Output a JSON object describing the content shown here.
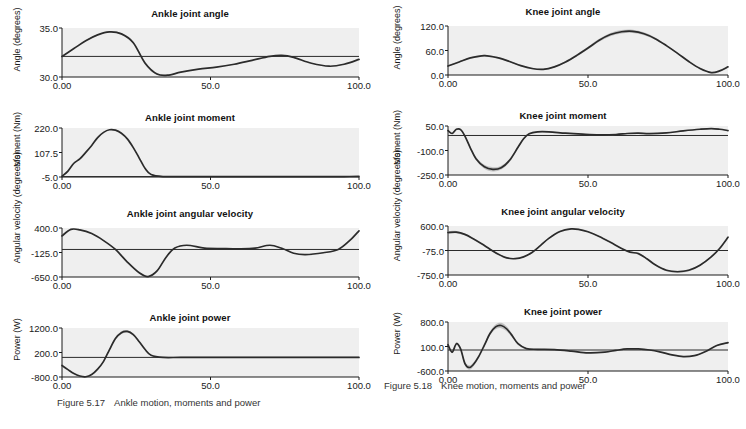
{
  "figures": [
    {
      "id": "ankle",
      "caption_number": "Figure 5.17",
      "caption_text": "Ankle motion, moments and power"
    },
    {
      "id": "knee",
      "caption_number": "Figure 5.18",
      "caption_text": "Knee motion, moments and power"
    }
  ],
  "chart_data": [
    {
      "type": "line",
      "id": "ankle-joint-angle",
      "title": "Ankle joint angle",
      "xlabel": "",
      "ylabel": "Angle (degrees)",
      "xlim": [
        0,
        100
      ],
      "ylim": [
        30.0,
        35.0
      ],
      "xticks": [
        0,
        50,
        100
      ],
      "xticklabels": [
        "0.00",
        "50.0",
        "100.0"
      ],
      "yticks": [
        35.0,
        30.0
      ],
      "yticklabels": [
        "35.0",
        "30.0"
      ],
      "grid": false,
      "mean_line": 32.1,
      "series": [
        {
          "name": "mean",
          "x": [
            0,
            4,
            8,
            12,
            16,
            20,
            24,
            28,
            32,
            36,
            40,
            46,
            52,
            58,
            64,
            70,
            74,
            78,
            84,
            90,
            95,
            100
          ],
          "values": [
            32.1,
            32.9,
            33.7,
            34.3,
            34.6,
            34.4,
            33.5,
            31.4,
            30.3,
            30.2,
            30.5,
            30.8,
            31.0,
            31.3,
            31.7,
            32.1,
            32.2,
            32.0,
            31.4,
            31.1,
            31.3,
            31.8
          ],
          "band_halfwidth": [
            0.02,
            0.03,
            0.04,
            0.05,
            0.06,
            0.09,
            0.13,
            0.14,
            0.09,
            0.04,
            0.03,
            0.02,
            0.02,
            0.02,
            0.02,
            0.02,
            0.02,
            0.02,
            0.02,
            0.02,
            0.02,
            0.02
          ]
        }
      ]
    },
    {
      "type": "line",
      "id": "ankle-joint-moment",
      "title": "Ankle joint moment",
      "xlabel": "",
      "ylabel": "Moment (Nm)",
      "xlim": [
        0,
        100
      ],
      "ylim": [
        -5.0,
        220.0
      ],
      "xticks": [
        0,
        50,
        100
      ],
      "xticklabels": [
        "0.00",
        "50.0",
        "100.0"
      ],
      "yticks": [
        220.0,
        107.5,
        -5.0
      ],
      "yticklabels": [
        "220.0",
        "107.5",
        "-5.0"
      ],
      "grid": false,
      "mean_line": -3.0,
      "series": [
        {
          "name": "mean",
          "x": [
            0,
            2,
            4,
            6,
            8,
            10,
            12,
            14,
            16,
            18,
            20,
            22,
            24,
            26,
            28,
            30,
            34,
            40,
            50,
            60,
            70,
            80,
            90,
            95,
            100
          ],
          "values": [
            -2.0,
            22.0,
            58.0,
            78.0,
            108.0,
            140.0,
            176.0,
            200.0,
            212.0,
            210.0,
            196.0,
            170.0,
            130.0,
            82.0,
            34.0,
            6.0,
            -3.0,
            -3.0,
            -3.0,
            -3.0,
            -3.0,
            -3.0,
            -3.5,
            -3.0,
            -2.5
          ]
        }
      ]
    },
    {
      "type": "line",
      "id": "ankle-joint-angular-velocity",
      "title": "Ankle joint angular velocity",
      "xlabel": "",
      "ylabel": "Angular velocity (degrees/s)",
      "xlim": [
        0,
        100
      ],
      "ylim": [
        -650.0,
        400.0
      ],
      "xticks": [
        0,
        50,
        100
      ],
      "xticklabels": [
        "0.00",
        "50.0",
        "100.0"
      ],
      "yticks": [
        400.0,
        -125.0,
        -650.0
      ],
      "yticklabels": [
        "400.0",
        "-125.0",
        "-650.0"
      ],
      "grid": false,
      "mean_line": -60.0,
      "series": [
        {
          "name": "mean",
          "x": [
            0,
            3,
            6,
            10,
            14,
            18,
            22,
            26,
            29,
            32,
            35,
            38,
            42,
            48,
            54,
            60,
            65,
            70,
            74,
            78,
            82,
            88,
            93,
            97,
            100
          ],
          "values": [
            230.0,
            370.0,
            360.0,
            280.0,
            130.0,
            -60.0,
            -330.0,
            -560.0,
            -640.0,
            -520.0,
            -230.0,
            -30.0,
            30.0,
            -30.0,
            -40.0,
            -45.0,
            -30.0,
            30.0,
            -35.0,
            -140.0,
            -170.0,
            -130.0,
            -60.0,
            140.0,
            340.0
          ],
          "band_halfwidth": [
            12,
            8,
            6,
            5,
            5,
            6,
            8,
            9,
            9,
            7,
            6,
            5,
            4,
            4,
            4,
            4,
            4,
            4,
            4,
            4,
            4,
            4,
            4,
            5,
            6
          ]
        }
      ]
    },
    {
      "type": "line",
      "id": "ankle-joint-power",
      "title": "Ankle joint power",
      "xlabel": "",
      "ylabel": "Power (W)",
      "xlim": [
        0,
        100
      ],
      "ylim": [
        -800.0,
        1200.0
      ],
      "xticks": [
        0,
        50,
        100
      ],
      "xticklabels": [
        "0.00",
        "50.0",
        "100.0"
      ],
      "yticks": [
        1200.0,
        200.0,
        -800.0
      ],
      "yticklabels": [
        "1200.0",
        "200.0",
        "-800.0"
      ],
      "grid": false,
      "mean_line": 0.0,
      "series": [
        {
          "name": "mean",
          "x": [
            0,
            2,
            4,
            6,
            8,
            10,
            12,
            14,
            16,
            18,
            20,
            22,
            24,
            26,
            28,
            30,
            34,
            40,
            50,
            60,
            70,
            80,
            90,
            100
          ],
          "values": [
            -330.0,
            -500.0,
            -660.0,
            -760.0,
            -790.0,
            -700.0,
            -480.0,
            -160.0,
            320.0,
            770.0,
            1010.0,
            1060.0,
            930.0,
            640.0,
            320.0,
            90.0,
            0.0,
            0.0,
            0.0,
            0.0,
            0.0,
            0.0,
            0.0,
            0.0
          ],
          "band_halfwidth": [
            14,
            14,
            14,
            16,
            16,
            18,
            22,
            30,
            42,
            52,
            58,
            52,
            44,
            34,
            22,
            14,
            8,
            6,
            6,
            6,
            6,
            6,
            6,
            6
          ]
        }
      ]
    },
    {
      "type": "line",
      "id": "knee-joint-angle",
      "title": "Knee joint angle",
      "xlabel": "",
      "ylabel": "Angle (degrees)",
      "xlim": [
        0,
        100
      ],
      "ylim": [
        0.0,
        120.0
      ],
      "xticks": [
        0,
        50,
        100
      ],
      "xticklabels": [
        "0.00",
        "50.0",
        "100.0"
      ],
      "yticks": [
        120.0,
        60.0,
        0.0
      ],
      "yticklabels": [
        "120.0",
        "60.0",
        "0.0"
      ],
      "grid": false,
      "mean_line": null,
      "series": [
        {
          "name": "mean",
          "x": [
            0,
            4,
            8,
            12,
            14,
            18,
            22,
            26,
            30,
            34,
            38,
            42,
            46,
            50,
            54,
            58,
            62,
            66,
            70,
            74,
            78,
            82,
            86,
            90,
            94,
            97,
            100
          ],
          "values": [
            22.0,
            32.0,
            42.0,
            47.0,
            47.0,
            42.0,
            33.0,
            23.0,
            16.0,
            14.0,
            20.0,
            32.0,
            48.0,
            66.0,
            85.0,
            99.0,
            106.0,
            107.0,
            101.0,
            89.0,
            72.0,
            53.0,
            33.0,
            16.0,
            6.0,
            10.0,
            20.0
          ],
          "band_halfwidth": [
            1.5,
            1.5,
            1.5,
            2.0,
            2.0,
            1.8,
            1.5,
            1.5,
            1.5,
            1.5,
            1.8,
            2.2,
            2.8,
            3.2,
            3.6,
            4.0,
            4.2,
            4.0,
            3.4,
            2.8,
            2.2,
            1.8,
            1.5,
            1.5,
            1.5,
            1.5,
            1.5
          ]
        }
      ]
    },
    {
      "type": "line",
      "id": "knee-joint-moment",
      "title": "Knee joint moment",
      "xlabel": "",
      "ylabel": "Moment (Nm)",
      "xlim": [
        0,
        100
      ],
      "ylim": [
        -250.0,
        50.0
      ],
      "xticks": [
        0,
        50,
        100
      ],
      "xticklabels": [
        "0.00",
        "50.0",
        "100.0"
      ],
      "yticks": [
        50.0,
        -100.0,
        -250.0
      ],
      "yticklabels": [
        "50.0",
        "-100.0",
        "-250.0"
      ],
      "grid": false,
      "mean_line": -8.0,
      "series": [
        {
          "name": "mean",
          "x": [
            0,
            1.5,
            3,
            4.5,
            6,
            8,
            10,
            13,
            16,
            19,
            22,
            25,
            27,
            29,
            32,
            36,
            42,
            48,
            54,
            60,
            64,
            68,
            72,
            78,
            84,
            90,
            94,
            97,
            100
          ],
          "values": [
            22.0,
            4.0,
            30.0,
            28.0,
            -10.0,
            -85.0,
            -150.0,
            -200.0,
            -215.0,
            -205.0,
            -160.0,
            -80.0,
            -28.0,
            2.0,
            14.0,
            14.0,
            6.0,
            0.0,
            -4.0,
            -2.0,
            4.0,
            6.0,
            3.0,
            8.0,
            20.0,
            30.0,
            34.0,
            30.0,
            22.0
          ],
          "band_halfwidth": [
            4,
            4,
            5,
            5,
            6,
            8,
            10,
            12,
            13,
            12,
            10,
            8,
            6,
            5,
            4,
            4,
            3,
            3,
            3,
            3,
            3,
            3,
            3,
            3,
            3,
            3,
            3,
            3,
            3
          ]
        }
      ]
    },
    {
      "type": "line",
      "id": "knee-joint-angular-velocity",
      "title": "Knee  joint angular velocity",
      "xlabel": "",
      "ylabel": "Angular velocity (degrees/s)",
      "xlim": [
        0,
        100
      ],
      "ylim": [
        -750.0,
        600.0
      ],
      "xticks": [
        0,
        50,
        100
      ],
      "xticklabels": [
        "0.00",
        "50.0",
        "100.0"
      ],
      "yticks": [
        600.0,
        -75.0,
        -750.0
      ],
      "yticklabels": [
        "600.0",
        "-75.0",
        "-750.0"
      ],
      "grid": false,
      "mean_line": -75.0,
      "series": [
        {
          "name": "mean",
          "x": [
            0,
            3,
            6,
            9,
            12,
            15,
            18,
            21,
            24,
            27,
            30,
            33,
            36,
            40,
            44,
            47,
            50,
            54,
            58,
            62,
            65,
            68,
            71,
            74,
            78,
            82,
            86,
            90,
            94,
            97,
            100
          ],
          "values": [
            420.0,
            430.0,
            370.0,
            250.0,
            110.0,
            -40.0,
            -180.0,
            -280.0,
            -300.0,
            -250.0,
            -130.0,
            60.0,
            260.0,
            450.0,
            520.0,
            500.0,
            440.0,
            310.0,
            150.0,
            -20.0,
            -120.0,
            -160.0,
            -300.0,
            -470.0,
            -620.0,
            -660.0,
            -620.0,
            -480.0,
            -250.0,
            -20.0,
            290.0
          ],
          "band_halfwidth": [
            40,
            34,
            26,
            18,
            14,
            12,
            12,
            12,
            12,
            12,
            12,
            14,
            16,
            18,
            18,
            16,
            14,
            12,
            12,
            12,
            12,
            12,
            14,
            18,
            24,
            28,
            26,
            20,
            16,
            14,
            14
          ]
        }
      ]
    },
    {
      "type": "line",
      "id": "knee-joint-power",
      "title": "Knee joint power",
      "xlabel": "",
      "ylabel": "Power (W)",
      "xlim": [
        0,
        100
      ],
      "ylim": [
        -600.0,
        800.0
      ],
      "xticks": [
        0,
        50,
        100
      ],
      "xticklabels": [
        "0.00",
        "50.0",
        "100.0"
      ],
      "yticks": [
        800.0,
        100.0,
        -600.0
      ],
      "yticklabels": [
        "800.0",
        "100.0",
        "-600.0"
      ],
      "grid": false,
      "mean_line": 0.0,
      "series": [
        {
          "name": "mean",
          "x": [
            0,
            1.5,
            3,
            4.5,
            6,
            7.5,
            9,
            11,
            13,
            15,
            17,
            19,
            21,
            23,
            25,
            28,
            32,
            38,
            44,
            50,
            56,
            60,
            64,
            68,
            72,
            76,
            80,
            84,
            88,
            92,
            96,
            100
          ],
          "values": [
            150.0,
            -60.0,
            180.0,
            30.0,
            -380.0,
            -500.0,
            -420.0,
            -180.0,
            140.0,
            470.0,
            660.0,
            700.0,
            600.0,
            400.0,
            180.0,
            40.0,
            20.0,
            10.0,
            -30.0,
            -80.0,
            -60.0,
            -10.0,
            30.0,
            30.0,
            0.0,
            -60.0,
            -140.0,
            -190.0,
            -160.0,
            -40.0,
            130.0,
            210.0
          ],
          "band_halfwidth": [
            30,
            34,
            40,
            46,
            56,
            62,
            58,
            46,
            44,
            56,
            70,
            76,
            68,
            52,
            34,
            20,
            14,
            10,
            10,
            10,
            10,
            10,
            10,
            10,
            10,
            10,
            10,
            10,
            10,
            10,
            12,
            14
          ]
        }
      ]
    }
  ]
}
